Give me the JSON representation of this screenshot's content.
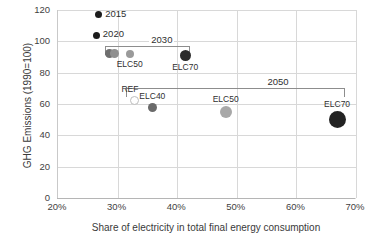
{
  "chart_data": {
    "type": "scatter",
    "title": "",
    "xlabel": "Share of electricity in total final energy consumption",
    "ylabel": "GHG Emissions (1990=100)",
    "xlim": [
      20,
      70
    ],
    "ylim": [
      0,
      120
    ],
    "xticks": [
      "20%",
      "30%",
      "40%",
      "50%",
      "60%",
      "70%"
    ],
    "xtick_values": [
      20,
      30,
      40,
      50,
      60,
      70
    ],
    "yticks": [
      "0",
      "20",
      "40",
      "60",
      "80",
      "100",
      "120"
    ],
    "ytick_values": [
      0,
      20,
      40,
      60,
      80,
      100,
      120
    ],
    "grid": true,
    "legend": "none",
    "points": [
      {
        "label": "2015",
        "x": 27.0,
        "y": 117,
        "size": 7,
        "color": "#1c1c1c",
        "filled": true,
        "label_pos": "right"
      },
      {
        "label": "2020",
        "x": 26.6,
        "y": 104,
        "size": 7,
        "color": "#1c1c1c",
        "filled": true,
        "label_pos": "right"
      },
      {
        "label": "REF",
        "x": 28.8,
        "y": 92,
        "size": 9,
        "color": "#6e6e6e",
        "filled": true,
        "group": "2030",
        "label_pos": "none"
      },
      {
        "label": "ELC40",
        "x": 29.6,
        "y": 92,
        "size": 9,
        "color": "#8f8f8f",
        "filled": true,
        "group": "2030",
        "label_pos": "none"
      },
      {
        "label": "ELC50",
        "x": 32.2,
        "y": 92,
        "size": 8,
        "color": "#9a9a9a",
        "filled": true,
        "group": "2030",
        "label_pos": "below"
      },
      {
        "label": "ELC70",
        "x": 41.5,
        "y": 91,
        "size": 11,
        "color": "#2b2b2b",
        "filled": true,
        "group": "2030",
        "label_pos": "below"
      },
      {
        "label": "REF",
        "x": 33.0,
        "y": 62,
        "size": 9,
        "color": "#bdbdbd",
        "filled": false,
        "group": "2050",
        "label_pos": "above"
      },
      {
        "label": "ELC40",
        "x": 36.0,
        "y": 58,
        "size": 9,
        "color": "#6a6a6a",
        "filled": true,
        "group": "2050",
        "label_pos": "above"
      },
      {
        "label": "ELC50",
        "x": 48.3,
        "y": 55,
        "size": 12,
        "color": "#a8a8a8",
        "filled": true,
        "group": "2050",
        "label_pos": "above"
      },
      {
        "label": "ELC70",
        "x": 67.0,
        "y": 50,
        "size": 17,
        "color": "#232323",
        "filled": true,
        "group": "2050",
        "label_pos": "above"
      }
    ],
    "groups": [
      {
        "name": "2030",
        "x_start": 28.1,
        "x_end": 42.3,
        "bracket_y": 97,
        "label": "2030",
        "label_x": 37.5,
        "label_y": 101
      },
      {
        "name": "2050",
        "x_start": 31.5,
        "x_end": 68.3,
        "bracket_y": 70,
        "label": "2050",
        "label_x": 57.0,
        "label_y": 74
      }
    ]
  }
}
